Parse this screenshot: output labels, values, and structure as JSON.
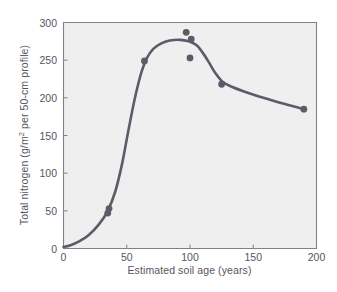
{
  "chart_data": {
    "type": "scatter",
    "title": "",
    "subtitle": "",
    "xlabel": "Estimated soil age (years)",
    "ylabel": "Total nitrogen (g/m² per 50-cm profile)",
    "ylabel_main": "Total nitrogen (g/m",
    "ylabel_sup": "2",
    "ylabel_tail": " per 50-cm profile)",
    "xlim": [
      0,
      200
    ],
    "ylim": [
      0,
      300
    ],
    "xticks": [
      0,
      50,
      100,
      150,
      200
    ],
    "yticks": [
      0,
      50,
      100,
      150,
      200,
      250,
      300
    ],
    "xtick_labels": [
      "0",
      "50",
      "100",
      "150",
      "200"
    ],
    "ytick_labels": [
      "0",
      "50",
      "100",
      "150",
      "200",
      "250",
      "300"
    ],
    "grid": false,
    "legend": null,
    "legend_position": "none",
    "plot_background": "#efefef",
    "axis_color": "#808088",
    "marker_color": "#5c5c68",
    "line_color": "#5c5c68",
    "text_color": "#55555f",
    "marker_radius": 3.4,
    "line_width": 2.6,
    "series": [
      {
        "name": "Total nitrogen",
        "points": [
          {
            "x": 35,
            "y": 47
          },
          {
            "x": 36,
            "y": 53
          },
          {
            "x": 64,
            "y": 249
          },
          {
            "x": 97,
            "y": 287
          },
          {
            "x": 101,
            "y": 278
          },
          {
            "x": 100,
            "y": 253
          },
          {
            "x": 125,
            "y": 218
          },
          {
            "x": 190,
            "y": 185
          }
        ],
        "fitted_curve": [
          {
            "x": 0,
            "y": 2
          },
          {
            "x": 5,
            "y": 4
          },
          {
            "x": 12,
            "y": 9
          },
          {
            "x": 20,
            "y": 18
          },
          {
            "x": 28,
            "y": 32
          },
          {
            "x": 35,
            "y": 50
          },
          {
            "x": 41,
            "y": 76
          },
          {
            "x": 46,
            "y": 110
          },
          {
            "x": 50,
            "y": 145
          },
          {
            "x": 54,
            "y": 180
          },
          {
            "x": 58,
            "y": 211
          },
          {
            "x": 62,
            "y": 236
          },
          {
            "x": 66,
            "y": 253
          },
          {
            "x": 71,
            "y": 265
          },
          {
            "x": 77,
            "y": 272
          },
          {
            "x": 84,
            "y": 276
          },
          {
            "x": 92,
            "y": 277
          },
          {
            "x": 99,
            "y": 275
          },
          {
            "x": 105,
            "y": 270
          },
          {
            "x": 110,
            "y": 260
          },
          {
            "x": 115,
            "y": 247
          },
          {
            "x": 120,
            "y": 233
          },
          {
            "x": 126,
            "y": 221
          },
          {
            "x": 134,
            "y": 214
          },
          {
            "x": 145,
            "y": 207
          },
          {
            "x": 158,
            "y": 200
          },
          {
            "x": 172,
            "y": 193
          },
          {
            "x": 190,
            "y": 185
          }
        ]
      }
    ]
  },
  "figure": {
    "caption": ""
  }
}
